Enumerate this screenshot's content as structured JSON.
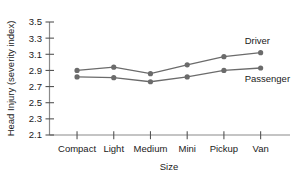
{
  "chart_data": {
    "type": "line",
    "title": "",
    "xlabel": "Size",
    "ylabel": "Head Injury (severity index)",
    "categories": [
      "Compact",
      "Light",
      "Medium",
      "Mini",
      "Pickup",
      "Van"
    ],
    "series": [
      {
        "name": "Driver",
        "values": [
          2.9,
          2.94,
          2.86,
          2.97,
          3.07,
          3.12
        ],
        "color": "#6b6b6b",
        "annotation_position": "above-right-of-last-point"
      },
      {
        "name": "Passenger",
        "values": [
          2.82,
          2.81,
          2.76,
          2.82,
          2.9,
          2.93
        ],
        "color": "#6b6b6b",
        "annotation_position": "below-right-of-last-point"
      }
    ],
    "ylim": [
      2.1,
      3.5
    ],
    "ytick_step": 0.2,
    "ytick_labels": [
      "2.1",
      "2.3",
      "2.5",
      "2.7",
      "2.9",
      "3.1",
      "3.3",
      "3.5"
    ],
    "ytick_values": [
      2.1,
      2.3,
      2.5,
      2.7,
      2.9,
      3.1,
      3.3,
      3.5
    ],
    "grid": false,
    "legend_position": "inline-annotations",
    "marker": "filled-circle"
  },
  "axes": {
    "y_title": "Head Injury (severity index)",
    "x_title": "Size"
  }
}
